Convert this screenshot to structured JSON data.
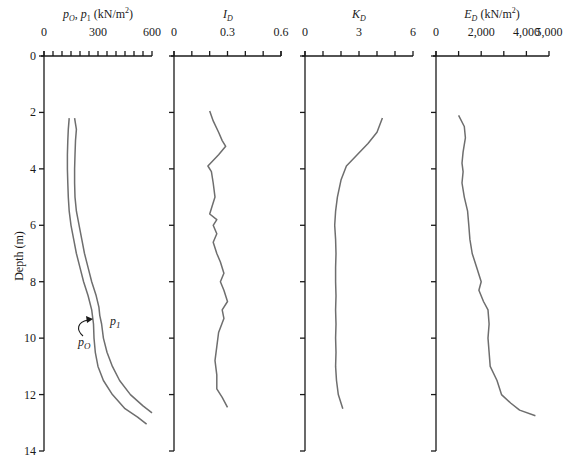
{
  "figure": {
    "y_axis_label": "Depth (m)",
    "depth_ticks": [
      "0",
      "2",
      "4",
      "6",
      "8",
      "10",
      "12",
      "14"
    ],
    "annotations": {
      "p0_label": "pO",
      "p1_label": "p1"
    }
  },
  "chart_data": [
    {
      "type": "line",
      "title": "pO, p1 (kN/m²)",
      "xlabel": "pO, p1 (kN/m²)",
      "ylabel": "Depth (m)",
      "xlim": [
        0,
        600
      ],
      "ylim": [
        14,
        0
      ],
      "x_tick_labels": [
        "0",
        "300",
        "600"
      ],
      "minor_tick_step": 50,
      "series": [
        {
          "name": "pO",
          "points": [
            [
              140,
              2.2
            ],
            [
              135,
              2.6
            ],
            [
              132,
              3.0
            ],
            [
              130,
              3.5
            ],
            [
              130,
              4.0
            ],
            [
              132,
              4.5
            ],
            [
              135,
              5.0
            ],
            [
              140,
              5.5
            ],
            [
              150,
              6.0
            ],
            [
              165,
              6.5
            ],
            [
              180,
              7.0
            ],
            [
              200,
              7.5
            ],
            [
              220,
              8.0
            ],
            [
              245,
              8.5
            ],
            [
              265,
              9.0
            ],
            [
              275,
              9.5
            ],
            [
              278,
              10.0
            ],
            [
              285,
              10.5
            ],
            [
              300,
              11.0
            ],
            [
              330,
              11.5
            ],
            [
              380,
              12.0
            ],
            [
              450,
              12.5
            ],
            [
              520,
              12.8
            ],
            [
              570,
              13.05
            ]
          ]
        },
        {
          "name": "p1",
          "points": [
            [
              170,
              2.2
            ],
            [
              180,
              2.6
            ],
            [
              175,
              3.0
            ],
            [
              172,
              3.5
            ],
            [
              170,
              4.0
            ],
            [
              170,
              4.5
            ],
            [
              172,
              5.0
            ],
            [
              180,
              5.5
            ],
            [
              195,
              6.0
            ],
            [
              210,
              6.5
            ],
            [
              225,
              7.0
            ],
            [
              245,
              7.5
            ],
            [
              265,
              8.0
            ],
            [
              290,
              8.5
            ],
            [
              305,
              8.9
            ],
            [
              310,
              9.2
            ],
            [
              320,
              9.5
            ],
            [
              330,
              10.0
            ],
            [
              350,
              10.5
            ],
            [
              380,
              11.0
            ],
            [
              420,
              11.5
            ],
            [
              480,
              12.0
            ],
            [
              550,
              12.4
            ],
            [
              600,
              12.65
            ]
          ]
        }
      ],
      "annotations": [
        "pO",
        "p1"
      ]
    },
    {
      "type": "line",
      "title": "ID",
      "xlabel": "ID",
      "xlim": [
        0,
        0.6
      ],
      "ylim": [
        14,
        0
      ],
      "x_tick_labels": [
        "0",
        "0.3",
        "0.6"
      ],
      "minor_tick_step": 0.1,
      "series": [
        {
          "name": "ID",
          "points": [
            [
              0.2,
              1.95
            ],
            [
              0.22,
              2.3
            ],
            [
              0.25,
              2.7
            ],
            [
              0.27,
              3.0
            ],
            [
              0.29,
              3.2
            ],
            [
              0.25,
              3.5
            ],
            [
              0.19,
              3.9
            ],
            [
              0.21,
              4.1
            ],
            [
              0.22,
              4.5
            ],
            [
              0.23,
              5.0
            ],
            [
              0.21,
              5.4
            ],
            [
              0.2,
              5.6
            ],
            [
              0.24,
              5.8
            ],
            [
              0.22,
              6.0
            ],
            [
              0.24,
              6.3
            ],
            [
              0.22,
              6.6
            ],
            [
              0.24,
              7.0
            ],
            [
              0.26,
              7.3
            ],
            [
              0.28,
              7.7
            ],
            [
              0.26,
              8.0
            ],
            [
              0.28,
              8.3
            ],
            [
              0.3,
              8.7
            ],
            [
              0.27,
              9.0
            ],
            [
              0.28,
              9.3
            ],
            [
              0.25,
              9.8
            ],
            [
              0.24,
              10.3
            ],
            [
              0.23,
              10.8
            ],
            [
              0.24,
              11.3
            ],
            [
              0.24,
              11.8
            ],
            [
              0.27,
              12.1
            ],
            [
              0.3,
              12.45
            ]
          ]
        }
      ]
    },
    {
      "type": "line",
      "title": "KD",
      "xlabel": "KD",
      "xlim": [
        0,
        6
      ],
      "ylim": [
        14,
        0
      ],
      "x_tick_labels": [
        "0",
        "3",
        "6"
      ],
      "minor_tick_step": 1,
      "series": [
        {
          "name": "KD",
          "points": [
            [
              4.3,
              2.2
            ],
            [
              4.0,
              2.7
            ],
            [
              3.5,
              3.1
            ],
            [
              2.9,
              3.5
            ],
            [
              2.3,
              3.9
            ],
            [
              2.0,
              4.4
            ],
            [
              1.8,
              5.0
            ],
            [
              1.7,
              5.5
            ],
            [
              1.65,
              6.0
            ],
            [
              1.7,
              6.5
            ],
            [
              1.72,
              7.0
            ],
            [
              1.7,
              7.5
            ],
            [
              1.7,
              8.0
            ],
            [
              1.72,
              8.5
            ],
            [
              1.7,
              9.0
            ],
            [
              1.72,
              9.5
            ],
            [
              1.7,
              10.0
            ],
            [
              1.72,
              10.5
            ],
            [
              1.7,
              11.0
            ],
            [
              1.75,
              11.5
            ],
            [
              1.85,
              12.0
            ],
            [
              2.1,
              12.5
            ]
          ]
        }
      ]
    },
    {
      "type": "line",
      "title": "ED (kN/m²)",
      "xlabel": "ED (kN/m²)",
      "xlim": [
        0,
        5000
      ],
      "ylim": [
        14,
        0
      ],
      "x_tick_labels": [
        "0",
        "2,000",
        "4,000",
        "5,000"
      ],
      "minor_tick_step": 1000,
      "series": [
        {
          "name": "ED",
          "points": [
            [
              1000,
              2.1
            ],
            [
              1250,
              2.5
            ],
            [
              1300,
              2.9
            ],
            [
              1200,
              3.4
            ],
            [
              1150,
              3.8
            ],
            [
              1200,
              4.1
            ],
            [
              1150,
              4.5
            ],
            [
              1250,
              5.0
            ],
            [
              1400,
              5.5
            ],
            [
              1450,
              6.0
            ],
            [
              1500,
              6.5
            ],
            [
              1600,
              7.0
            ],
            [
              1800,
              7.5
            ],
            [
              2000,
              8.0
            ],
            [
              1900,
              8.3
            ],
            [
              2100,
              8.7
            ],
            [
              2300,
              9.0
            ],
            [
              2350,
              9.5
            ],
            [
              2300,
              10.0
            ],
            [
              2350,
              10.5
            ],
            [
              2400,
              11.0
            ],
            [
              2700,
              11.5
            ],
            [
              2900,
              12.0
            ],
            [
              3300,
              12.3
            ],
            [
              3700,
              12.55
            ],
            [
              4400,
              12.75
            ]
          ]
        }
      ]
    }
  ]
}
